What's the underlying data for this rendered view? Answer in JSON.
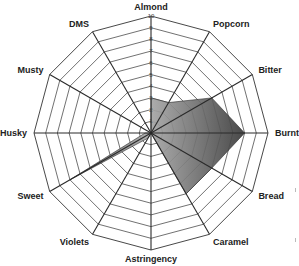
{
  "chart_data": {
    "type": "radar",
    "title": "",
    "categories": [
      "Almond",
      "Popcorn",
      "Bitter",
      "Burnt",
      "Bread",
      "Caramel",
      "Astringency",
      "Violets",
      "Sweet",
      "Husky",
      "Musty",
      "DMS"
    ],
    "series": [
      {
        "name": "Sample",
        "values": [
          3,
          3,
          6,
          8,
          6,
          6,
          0,
          0.5,
          8,
          0.5,
          0,
          0
        ]
      }
    ],
    "rlim": [
      0,
      10
    ],
    "ticks": [
      "1",
      "2",
      "3",
      "4",
      "5",
      "6",
      "7",
      "8",
      "9",
      "10"
    ],
    "grid": true,
    "legend": "none",
    "colors": {
      "fill_dark": "#3a3a3a",
      "fill_light": "#9a9a9a",
      "grid": "#333333"
    }
  }
}
